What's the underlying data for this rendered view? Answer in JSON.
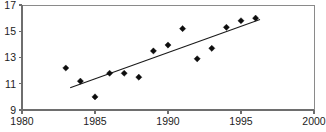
{
  "chart_data": {
    "type": "scatter",
    "title": "",
    "subtitle": "",
    "xlabel": "",
    "ylabel": "",
    "xlim": [
      1980,
      2000
    ],
    "ylim": [
      9,
      17
    ],
    "xticks": [
      1980,
      1985,
      1990,
      1995,
      2000
    ],
    "yticks": [
      9,
      11,
      13,
      15,
      17
    ],
    "xtick_labels": [
      "1980",
      "1985",
      "1990",
      "1995",
      "2000"
    ],
    "ytick_labels": [
      "9",
      "11",
      "13",
      "15",
      "17"
    ],
    "grid": false,
    "legend": null,
    "legend_position": "none",
    "marker_shape": "diamond",
    "marker_color": "#0d0d0d",
    "series": [
      {
        "name": "observations",
        "x": [
          1983,
          1984,
          1985,
          1986,
          1987,
          1988,
          1989,
          1990,
          1991,
          1992,
          1993,
          1994,
          1995,
          1996
        ],
        "values": [
          12.2,
          11.2,
          10.0,
          11.8,
          11.8,
          11.5,
          13.5,
          13.95,
          15.2,
          12.9,
          13.7,
          15.3,
          15.8,
          16.0
        ]
      }
    ],
    "trendline": {
      "name": "linear-fit",
      "x": [
        1983.3,
        1996.3
      ],
      "y": [
        10.7,
        15.9
      ],
      "color": "#1a1a1a"
    },
    "annotations": []
  },
  "axes": {
    "frame_color": "#8a8a8a",
    "axis_color": "#6e6e6e",
    "tick_label_color": "#222222"
  },
  "canvas": {
    "width": 326,
    "height": 132,
    "background": "#ffffff",
    "plot_left": 22,
    "plot_right": 314,
    "plot_top": 5,
    "plot_bottom": 110
  }
}
